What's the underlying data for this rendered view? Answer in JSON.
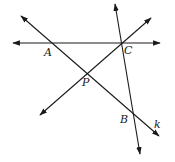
{
  "diagram": {
    "type": "geometry-lines",
    "stroke_color": "#1a1a1a",
    "background": "#ffffff",
    "points": {
      "A": {
        "label": "A",
        "x": 52,
        "y": 43,
        "label_x": 44,
        "label_y": 56
      },
      "C": {
        "label": "C",
        "x": 121,
        "y": 43,
        "label_x": 124,
        "label_y": 54
      },
      "P": {
        "label": "P",
        "x": 87,
        "y": 73,
        "label_x": 82,
        "label_y": 86
      },
      "B": {
        "label": "B",
        "x": 133,
        "y": 114,
        "label_x": 120,
        "label_y": 123
      }
    },
    "lines": [
      {
        "name": "line-AC",
        "through": [
          "A",
          "C"
        ],
        "x1": 13,
        "y1": 43,
        "x2": 160,
        "y2": 43
      },
      {
        "name": "line-k",
        "through": [
          "A",
          "P",
          "B"
        ],
        "label": "k",
        "label_x": 154,
        "label_y": 128,
        "x1": 21,
        "y1": 16,
        "x2": 159,
        "y2": 136
      },
      {
        "name": "line-PC",
        "through": [
          "P",
          "C"
        ],
        "x1": 40,
        "y1": 115,
        "x2": 151,
        "y2": 18
      },
      {
        "name": "line-CB",
        "through": [
          "C",
          "B"
        ],
        "x1": 115,
        "y1": 4,
        "x2": 140,
        "y2": 154
      }
    ]
  }
}
